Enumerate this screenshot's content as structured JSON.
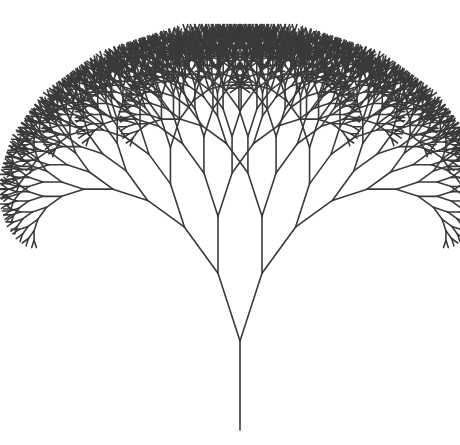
{
  "figure": {
    "title": "",
    "type": "fractal-binary-tree",
    "background_color": "#ffffff",
    "stroke_color": "#3a3a3a"
  },
  "tree": {
    "trunk_base": [
      240,
      430
    ],
    "trunk_length": 89,
    "branch_angle_deg": 18,
    "length_ratio": 0.8,
    "depth": 11,
    "line_width": 1.6
  }
}
